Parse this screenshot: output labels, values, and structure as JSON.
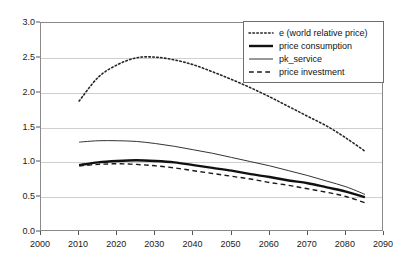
{
  "chart_data": {
    "type": "line",
    "title": "",
    "subtitle": "",
    "xlabel": "",
    "ylabel": "",
    "xlim": [
      2000,
      2090
    ],
    "ylim": [
      0.0,
      3.0
    ],
    "xticks": [
      "2000",
      "2010",
      "2020",
      "2030",
      "2040",
      "2050",
      "2060",
      "2070",
      "2080",
      "2090"
    ],
    "yticks": [
      "0.0",
      "0.5",
      "1.0",
      "1.5",
      "2.0",
      "2.5",
      "3.0"
    ],
    "grid": "horizontal",
    "legend_position": "top-right",
    "x": [
      2010,
      2015,
      2020,
      2025,
      2030,
      2035,
      2040,
      2045,
      2050,
      2055,
      2060,
      2065,
      2070,
      2075,
      2080,
      2085
    ],
    "series": [
      {
        "name": "e (world relative price)",
        "style": "dotted",
        "color": "#262626",
        "width": 1.6,
        "values": [
          1.88,
          2.22,
          2.4,
          2.5,
          2.51,
          2.47,
          2.4,
          2.3,
          2.19,
          2.07,
          1.94,
          1.8,
          1.66,
          1.52,
          1.35,
          1.16
        ]
      },
      {
        "name": "price consumption",
        "style": "solid-thick",
        "color": "#111111",
        "width": 2.4,
        "values": [
          0.96,
          1.0,
          1.02,
          1.03,
          1.02,
          1.0,
          0.96,
          0.92,
          0.88,
          0.83,
          0.79,
          0.74,
          0.7,
          0.64,
          0.58,
          0.5
        ]
      },
      {
        "name": "pk_service",
        "style": "solid-thin",
        "color": "#333333",
        "width": 1.0,
        "values": [
          1.29,
          1.31,
          1.31,
          1.3,
          1.27,
          1.23,
          1.18,
          1.13,
          1.07,
          1.01,
          0.95,
          0.88,
          0.81,
          0.73,
          0.65,
          0.54
        ]
      },
      {
        "name": "price investment",
        "style": "dashed",
        "color": "#1a1a1a",
        "width": 1.4,
        "values": [
          0.95,
          0.97,
          0.98,
          0.97,
          0.95,
          0.92,
          0.88,
          0.84,
          0.8,
          0.76,
          0.71,
          0.67,
          0.62,
          0.57,
          0.51,
          0.42
        ]
      }
    ]
  },
  "legend": {
    "items": [
      {
        "label": "e (world relative price)",
        "style": "dotted"
      },
      {
        "label": "price consumption",
        "style": "solid-thick"
      },
      {
        "label": "pk_service",
        "style": "solid-thin"
      },
      {
        "label": "price investment",
        "style": "dashed"
      }
    ]
  }
}
